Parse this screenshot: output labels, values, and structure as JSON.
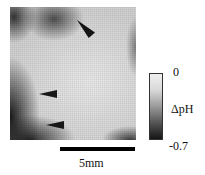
{
  "figure": {
    "type": "pH imaging map (grayscale)",
    "colorbar": {
      "max_label": "0",
      "quantity_label": "ΔpH",
      "min_label": "-0.7",
      "gradient_colors": [
        "#f0f0f0",
        "#151515"
      ]
    },
    "scalebar": {
      "label": "5mm"
    },
    "arrowheads": [
      {
        "name": "arrowhead-top",
        "direction": "down-right"
      },
      {
        "name": "arrowhead-middle",
        "direction": "left"
      },
      {
        "name": "arrowhead-bottom",
        "direction": "left"
      }
    ]
  }
}
